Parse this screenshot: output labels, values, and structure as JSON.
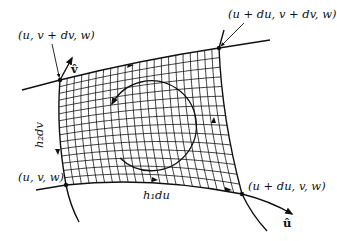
{
  "diagram": {
    "corner_labels": {
      "top_left": "(u, v + dv, w)",
      "top_right": "(u + du, v + dv, w)",
      "bottom_left": "(u, v, w)",
      "bottom_right": "(u + du, v, w)"
    },
    "edge_labels": {
      "bottom": "h₁du",
      "left": "h₂dv"
    },
    "unit_vectors": {
      "u_hat": "û",
      "v_hat": "v̂"
    },
    "colors": {
      "ink": "#111111",
      "background": "#ffffff"
    }
  }
}
